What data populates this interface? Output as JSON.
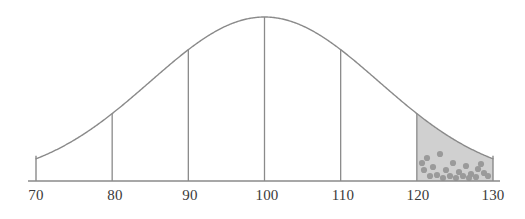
{
  "figure": {
    "title": "",
    "background_color": "#ffffff",
    "width": 525,
    "height": 219,
    "curve_color": "#8a8a8a",
    "axis_color": "#8a8a8a",
    "ordinate_color": "#8a8a8a",
    "shade_fill_color": "#d0d0d0",
    "shade_dot_color": "#9a9a9a",
    "label_color": "#3a3a3a"
  },
  "axis": {
    "name": "x-axis",
    "baseline_y": 181,
    "start_x": 28,
    "end_x": 500,
    "tick_labels": [
      "70",
      "80",
      "90",
      "100",
      "110",
      "120",
      "130"
    ],
    "tick_positions_px": [
      36,
      115,
      190,
      267,
      343,
      418,
      493
    ],
    "end_caps": [
      "70",
      "130"
    ]
  },
  "labels": [
    {
      "text": "70",
      "x": 36
    },
    {
      "text": "80",
      "x": 115
    },
    {
      "text": "90",
      "x": 190
    },
    {
      "text": "100",
      "x": 267
    },
    {
      "text": "110",
      "x": 343
    },
    {
      "text": "120",
      "x": 418
    },
    {
      "text": "130",
      "x": 493
    }
  ],
  "ordinates": [
    {
      "name": "ordinate-80",
      "at": 80,
      "x": 115,
      "top_y": 150
    },
    {
      "name": "ordinate-90",
      "at": 90,
      "x": 190,
      "top_y": 78
    },
    {
      "name": "ordinate-100",
      "at": 100,
      "x": 267,
      "top_y": 17
    },
    {
      "name": "ordinate-110",
      "at": 110,
      "x": 343,
      "top_y": 78
    },
    {
      "name": "ordinate-120",
      "at": 120,
      "x": 418,
      "top_y": 150
    }
  ],
  "shaded_region": {
    "name": "right-tail-shaded-area",
    "from": 120,
    "to": 130,
    "from_x": 418,
    "to_x": 493,
    "pattern": "stippled-dots"
  },
  "chart_data": {
    "type": "line",
    "title": "",
    "xlabel": "",
    "ylabel": "",
    "distribution": "normal",
    "mean": 100,
    "std_dev": 15,
    "xlim": [
      70,
      130
    ],
    "ylim": [
      0,
      1
    ],
    "grid": false,
    "legend": null,
    "x_ticks": [
      70,
      80,
      90,
      100,
      110,
      120,
      130
    ],
    "x": [
      70,
      75,
      80,
      85,
      90,
      95,
      100,
      105,
      110,
      115,
      120,
      125,
      130
    ],
    "y": [
      0.011,
      0.051,
      0.188,
      0.456,
      0.742,
      0.946,
      1.0,
      0.946,
      0.742,
      0.456,
      0.188,
      0.051,
      0.011
    ],
    "ordinate_values": [
      {
        "x": 80,
        "y": 0.188
      },
      {
        "x": 90,
        "y": 0.742
      },
      {
        "x": 100,
        "y": 1.0
      },
      {
        "x": 110,
        "y": 0.742
      },
      {
        "x": 120,
        "y": 0.188
      }
    ],
    "shaded_interval": [
      120,
      130
    ],
    "annotations": []
  }
}
